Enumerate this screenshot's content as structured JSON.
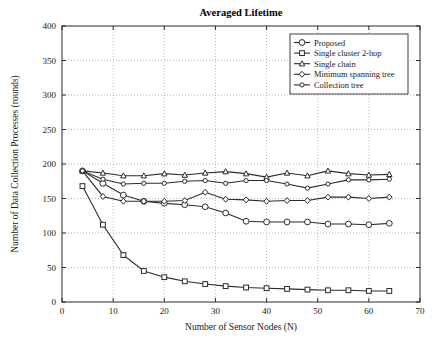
{
  "chart_data": {
    "type": "line",
    "title": "Averaged Lifetime",
    "xlabel": "Number of Sensor Nodes (N)",
    "ylabel": "Number of Data Collection Processes (rounds)",
    "xlim": [
      0,
      70
    ],
    "ylim": [
      0,
      400
    ],
    "xticks": [
      0,
      10,
      20,
      30,
      40,
      50,
      60,
      70
    ],
    "yticks": [
      0,
      50,
      100,
      150,
      200,
      250,
      300,
      350,
      400
    ],
    "grid": true,
    "legend_position": "top-right",
    "x": [
      4,
      8,
      12,
      16,
      20,
      24,
      28,
      32,
      36,
      40,
      44,
      48,
      52,
      56,
      60,
      64
    ],
    "series": [
      {
        "name": "Proposed",
        "marker": "circle",
        "values": [
          190,
          172,
          155,
          146,
          143,
          141,
          138,
          129,
          117,
          116,
          116,
          116,
          113,
          113,
          112,
          114
        ]
      },
      {
        "name": "Single cluster 2-hop",
        "marker": "square",
        "values": [
          168,
          112,
          68,
          45,
          36,
          30,
          26,
          23,
          21,
          20,
          19,
          18,
          17,
          17,
          16,
          16
        ]
      },
      {
        "name": "Single chain",
        "marker": "triangle",
        "values": [
          190,
          187,
          183,
          183,
          186,
          184,
          187,
          189,
          186,
          181,
          187,
          183,
          190,
          186,
          184,
          185
        ]
      },
      {
        "name": "Minimum spanning tree",
        "marker": "diamond",
        "values": [
          190,
          153,
          146,
          146,
          146,
          147,
          159,
          149,
          148,
          146,
          147,
          147,
          152,
          152,
          150,
          152
        ]
      },
      {
        "name": "Collection tree",
        "marker": "circle-small",
        "values": [
          190,
          178,
          171,
          172,
          172,
          175,
          176,
          172,
          176,
          176,
          171,
          165,
          171,
          177,
          177,
          178
        ]
      }
    ]
  }
}
